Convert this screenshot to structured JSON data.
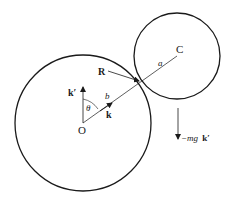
{
  "diagram": {
    "colors": {
      "stroke": "#1a1a1a",
      "background": "#ffffff"
    },
    "large_circle": {
      "cx": 83,
      "cy": 123,
      "r": 68,
      "center_label": "O"
    },
    "small_circle": {
      "cx": 177,
      "cy": 56,
      "r": 43,
      "center_label": "C"
    },
    "labels": {
      "O": "O",
      "C": "C",
      "R": "R",
      "a": "a",
      "b": "b",
      "theta": "θ",
      "k": "k",
      "k_prime": "k′",
      "gravity_prefix": "−mg",
      "gravity_vec": "k′"
    }
  }
}
